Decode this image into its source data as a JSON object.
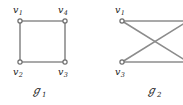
{
  "figure": {
    "background_color": "#ffffff",
    "edge_color": "#8c8c8c",
    "vertex_stroke_color": "#6e6e6e",
    "vertex_fill_color": "#ffffff",
    "label_color": "#1a1a1a",
    "width": 183,
    "height": 105,
    "note": "Right-hand vertices of the second graph are cropped off the right edge of the image."
  },
  "graphs": [
    {
      "id": "graph-1",
      "caption": "ℊ",
      "caption_subscript": "1",
      "shape": "square",
      "vertices": [
        {
          "id": "v1",
          "label": "v",
          "subscript": "1",
          "x": 20,
          "y": 21,
          "label_x": 13,
          "label_y": 5,
          "label_anchor": "above-left"
        },
        {
          "id": "v4",
          "label": "v",
          "subscript": "4",
          "x": 65,
          "y": 21,
          "label_x": 58,
          "label_y": 5,
          "label_anchor": "above-left"
        },
        {
          "id": "v2",
          "label": "v",
          "subscript": "2",
          "x": 20,
          "y": 62,
          "label_x": 13,
          "label_y": 67,
          "label_anchor": "below-left"
        },
        {
          "id": "v3",
          "label": "v",
          "subscript": "3",
          "x": 65,
          "y": 62,
          "label_x": 58,
          "label_y": 67,
          "label_anchor": "below-left"
        }
      ],
      "edges": [
        {
          "from": "v1",
          "to": "v4"
        },
        {
          "from": "v4",
          "to": "v3"
        },
        {
          "from": "v3",
          "to": "v2"
        },
        {
          "from": "v2",
          "to": "v1"
        }
      ],
      "caption_x": 31,
      "caption_y": 85
    },
    {
      "id": "graph-2",
      "caption": "ℊ",
      "caption_subscript": "2",
      "shape": "crossed-bipartite",
      "vertices": [
        {
          "id": "v1",
          "label": "v",
          "subscript": "1",
          "x": 30,
          "y": 21,
          "label_x": 23,
          "label_y": 5,
          "label_anchor": "above-left"
        },
        {
          "id": "v3",
          "label": "v",
          "subscript": "3",
          "x": 30,
          "y": 62,
          "label_x": 23,
          "label_y": 67,
          "label_anchor": "below-left"
        },
        {
          "id": "vA",
          "label": "",
          "subscript": "",
          "x": 96,
          "y": 21,
          "label_x": 0,
          "label_y": 0,
          "label_anchor": "offscreen"
        },
        {
          "id": "vB",
          "label": "",
          "subscript": "",
          "x": 96,
          "y": 62,
          "label_x": 0,
          "label_y": 0,
          "label_anchor": "offscreen"
        }
      ],
      "edges": [
        {
          "from": "v1",
          "to": "vA"
        },
        {
          "from": "v3",
          "to": "vB"
        },
        {
          "from": "v1",
          "to": "vB"
        },
        {
          "from": "v3",
          "to": "vA"
        }
      ],
      "caption_x": 54,
      "caption_y": 85
    }
  ]
}
